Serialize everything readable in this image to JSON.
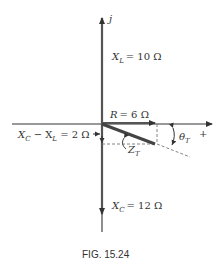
{
  "diagram": {
    "type": "impedance-phasor",
    "axes": {
      "imaginary_label": "j",
      "real_label": "+"
    },
    "phasors": {
      "XL": {
        "symbol": "X",
        "sub": "L",
        "value_text": "= 10 Ω",
        "magnitude": 10,
        "direction": "up"
      },
      "XC": {
        "symbol": "X",
        "sub": "C",
        "value_text": "= 12 Ω",
        "magnitude": 12,
        "direction": "down"
      },
      "R": {
        "symbol": "R",
        "value_text": "= 6 Ω",
        "magnitude": 6,
        "direction": "right"
      },
      "net": {
        "text_a": "X",
        "sub_a": "C",
        "text_mid": " − X",
        "sub_b": "L",
        "value_text": " = 2 Ω",
        "magnitude": 2
      },
      "ZT": {
        "symbol": "Z",
        "sub": "T"
      },
      "theta": {
        "symbol": "θ",
        "sub": "T"
      }
    },
    "caption": "FIG. 15.24",
    "colors": {
      "ink": "#333333",
      "phasor": "#555555",
      "dashed": "#777777"
    }
  }
}
